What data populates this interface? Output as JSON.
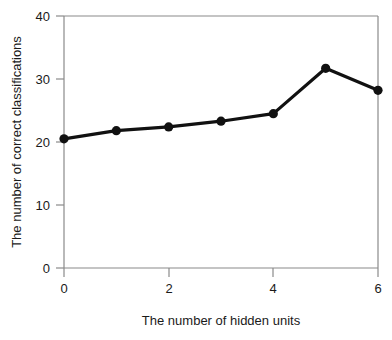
{
  "chart_data": {
    "type": "line",
    "title": "",
    "xlabel": "The number of hidden units",
    "ylabel": "The number of correct classifications",
    "x": [
      0,
      1,
      2,
      3,
      4,
      5,
      6
    ],
    "values": [
      20.5,
      21.8,
      22.4,
      23.3,
      24.5,
      31.7,
      28.2
    ],
    "series": [
      {
        "name": "correct classifications",
        "values": [
          20.5,
          21.8,
          22.4,
          23.3,
          24.5,
          31.7,
          28.2
        ]
      }
    ],
    "xlim": [
      0,
      6
    ],
    "ylim": [
      0,
      40
    ],
    "xticks": [
      0,
      2,
      4,
      6
    ],
    "xtick_labels": [
      "0",
      "2",
      "4",
      "6"
    ],
    "x_minor_ticks": [
      1,
      3,
      5
    ],
    "yticks": [
      0,
      10,
      20,
      30,
      40
    ],
    "ytick_labels": [
      "0",
      "10",
      "20",
      "30",
      "40"
    ],
    "y_minor_ticks": [
      5,
      15,
      25,
      35
    ],
    "grid": false,
    "legend": null,
    "legend_position": "none",
    "marker": "filled-circle",
    "line_color": "#111111",
    "marker_color": "#111111",
    "axis_color": "#8a8a8a",
    "text_color": "#1a1a1a",
    "background_color": "#ffffff"
  },
  "axes": {
    "y_tick_labels": [
      "40",
      "30",
      "20",
      "10",
      "0"
    ],
    "x_tick_labels": [
      "0",
      "2",
      "4",
      "6"
    ],
    "x_axis_title": "The number of hidden units",
    "y_axis_title": "The number of correct classifications"
  }
}
